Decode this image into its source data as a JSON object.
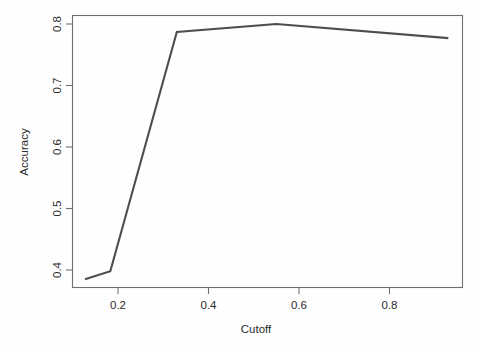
{
  "chart_data": {
    "type": "line",
    "title": "",
    "subtitle": "",
    "xlabel": "Cutoff",
    "ylabel": "Accuracy",
    "xlim": [
      0.115,
      0.978
    ],
    "ylim": [
      0.377,
      0.818
    ],
    "grid": false,
    "legend": null,
    "x_ticks": [
      0.2,
      0.4,
      0.6,
      0.8
    ],
    "x_tick_labels": [
      "0.2",
      "0.4",
      "0.6",
      "0.8"
    ],
    "y_ticks": [
      0.4,
      0.5,
      0.6,
      0.7,
      0.8
    ],
    "y_tick_labels": [
      "0.4",
      "0.5",
      "0.6",
      "0.7",
      "0.8"
    ],
    "series": [
      {
        "name": "Accuracy",
        "color": "#4d4d4d",
        "x": [
          0.127,
          0.183,
          0.33,
          0.55,
          0.93
        ],
        "y": [
          0.385,
          0.398,
          0.787,
          0.8,
          0.777
        ]
      }
    ],
    "annotations": []
  },
  "axes": {
    "frame_color": "#6f6f6f",
    "tick_label_color": "#2b2b2b",
    "x_label": "Cutoff",
    "y_label": "Accuracy"
  }
}
